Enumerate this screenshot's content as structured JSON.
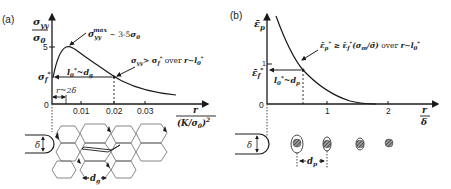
{
  "panel_a": {
    "label": "(a)",
    "y_axis_label_num": "σyy",
    "y_axis_label_den": "σ0",
    "x_axis_label_num": "r",
    "x_axis_label_den": "(K/σ0)²",
    "y_ticks": [
      {
        "label": "5"
      },
      {
        "label": "σf*"
      },
      {
        "label": "0"
      }
    ],
    "x_ticks": [
      {
        "label": "0.01"
      },
      {
        "label": "0.02"
      },
      {
        "label": "0.03"
      }
    ],
    "annotation_peak": "σyy^max ~ 3-5σ0",
    "annotation_peak_main": "σ",
    "annotation_peak_sub": "yy",
    "annotation_peak_sup": "max",
    "annotation_peak_rest": " ~ 3-5σ0",
    "annotation_criterion": "σyy> σf* over r~l0*",
    "length_label": "l0*~dg",
    "blunting_label": "r~2δ",
    "delta_label": "δ",
    "grain_label": "dg"
  },
  "panel_b": {
    "label": "(b)",
    "y_axis_label": "ε̄p",
    "x_axis_label_num": "r",
    "x_axis_label_den": "δ",
    "y_ticks": [
      {
        "label": "1"
      },
      {
        "label": "ε̄f*"
      },
      {
        "label": "0"
      }
    ],
    "x_ticks": [
      {
        "label": "1"
      },
      {
        "label": "2"
      }
    ],
    "annotation_criterion": "ε̄p* ≥ ε̄f*(σm/σ̄) over r~l0*",
    "length_label": "l0*~dp",
    "delta_label": "δ",
    "particle_label": "dp"
  },
  "colors": {
    "ink": "#1a1a1a",
    "background": "#ffffff",
    "particle_fill": "#6e6e6e"
  }
}
